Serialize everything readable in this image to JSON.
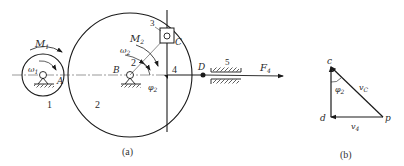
{
  "figure_a": {
    "caption": "(a)",
    "gear1": {
      "number": "1",
      "point": "A",
      "moment": "M",
      "moment_sub": "1",
      "omega": "ω",
      "omega_sub": "1"
    },
    "gear2": {
      "number": "2",
      "point": "B",
      "moment": "M",
      "moment_sub": "2",
      "omega": "ω",
      "omega_sub": "2",
      "angle": "φ",
      "angle_sub": "2",
      "arrow_label": "2"
    },
    "slider": {
      "number": "3",
      "point": "C"
    },
    "rod": {
      "number": "4",
      "point": "D"
    },
    "guide": {
      "number": "5"
    },
    "force": {
      "label": "F",
      "sub": "4"
    }
  },
  "figure_b": {
    "caption": "(b)",
    "vertices": {
      "c": "c",
      "d": "d",
      "p": "p"
    },
    "angle": "φ",
    "angle_sub": "2",
    "vc": "v",
    "vc_sub": "C",
    "v4": "v",
    "v4_sub": "4"
  },
  "colors": {
    "line": "#1a1a1a",
    "background": "#ffffff"
  }
}
